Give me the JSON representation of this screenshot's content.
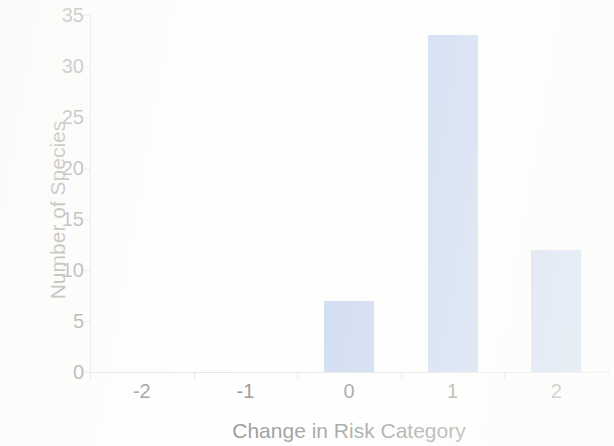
{
  "chart_data": {
    "type": "bar",
    "title": "",
    "xlabel": "Change in Risk Category",
    "ylabel": "Number of Species",
    "categories": [
      "-2",
      "-1",
      "0",
      "1",
      "2"
    ],
    "values": [
      0,
      0,
      7,
      33,
      12
    ],
    "ylim": [
      0,
      35
    ],
    "y_ticks": [
      0,
      5,
      10,
      15,
      20,
      25,
      30,
      35
    ],
    "y_tick_labels": [
      "0",
      "5",
      "10",
      "15",
      "20",
      "25",
      "30",
      "35"
    ],
    "grid": false,
    "legend": false,
    "bar_color": "#95b3e2",
    "axis_color": "#c9c9c9",
    "text_color": "#2b2b2b",
    "background_color": "#ffffff",
    "series": [
      {
        "name": "Number of Species",
        "values": [
          0,
          0,
          7,
          33,
          12
        ]
      }
    ]
  }
}
